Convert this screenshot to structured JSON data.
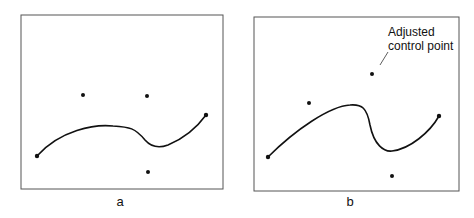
{
  "figure": {
    "panels": [
      {
        "label": "a",
        "description": "Bezier curve with original control points",
        "endpoints": [
          [
            37,
            156
          ],
          [
            206,
            115
          ]
        ],
        "control_points": [
          [
            83,
            95
          ],
          [
            147,
            96
          ],
          [
            148,
            172
          ]
        ]
      },
      {
        "label": "b",
        "description": "Bezier curve after control point adjustment",
        "endpoints": [
          [
            268,
            157
          ],
          [
            439,
            116
          ]
        ],
        "control_points": [
          [
            309,
            103
          ],
          [
            372,
            74
          ],
          [
            392,
            176
          ]
        ],
        "annotation": {
          "line1": "Adjusted",
          "line2": "control point"
        }
      }
    ]
  }
}
